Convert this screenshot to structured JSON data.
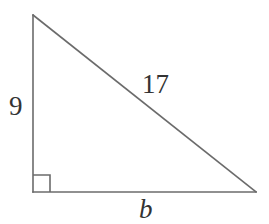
{
  "figure": {
    "name": "right-triangle-diagram",
    "background_color": "#ffffff",
    "stroke_color": "#6b6b6b",
    "text_color": "#333333",
    "stroke_width": 1.6,
    "canvas": {
      "width": 269,
      "height": 224
    },
    "vertices": {
      "apex": {
        "x": 33,
        "y": 15
      },
      "bottom_left": {
        "x": 33,
        "y": 192
      },
      "bottom_right": {
        "x": 256,
        "y": 192
      }
    },
    "right_angle_marker": {
      "name": "right-angle-square",
      "x": 33,
      "y": 175,
      "size": 17,
      "at_vertex": "bottom_left"
    },
    "labels": {
      "vertical_leg": "9",
      "hypotenuse": "17",
      "horizontal_leg": "b"
    }
  }
}
